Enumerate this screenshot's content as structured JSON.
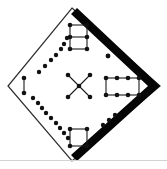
{
  "figure": {
    "canvas": {
      "width": 167,
      "height": 169,
      "background": "#ffffff"
    },
    "colors": {
      "node": "#111111",
      "link": "#1a1a1a",
      "outline": "#2b2b2b",
      "band": "#050505",
      "rule": "#d2d2d2"
    },
    "diamond": {
      "label": "diamond-outline",
      "points": "72,8 160,86 72,161 8,86",
      "top": [
        72,
        8
      ],
      "right": [
        160,
        86
      ],
      "bottom": [
        72,
        161
      ],
      "left": [
        8,
        86
      ]
    },
    "band": {
      "label": "thick-black-band",
      "points": "77,8 160,86 77,161 71,155 148,86 71,14"
    },
    "page_rule": {
      "label": "page-separator-line",
      "y": 160,
      "x1": 0,
      "x2": 167
    },
    "groups": [
      {
        "name": "top-rectangle",
        "kind": "grid-graph",
        "node_radius": 2.3,
        "nodes": [
          [
            70,
            25
          ],
          [
            87,
            25
          ],
          [
            70,
            37
          ],
          [
            87,
            37
          ],
          [
            70,
            49
          ],
          [
            87,
            49
          ]
        ],
        "edges": [
          [
            0,
            1
          ],
          [
            2,
            3
          ],
          [
            4,
            5
          ],
          [
            0,
            2
          ],
          [
            2,
            4
          ],
          [
            1,
            3
          ],
          [
            3,
            5
          ]
        ]
      },
      {
        "name": "right-rectangle",
        "kind": "grid-graph",
        "node_radius": 2.3,
        "nodes": [
          [
            106,
            78
          ],
          [
            117,
            78
          ],
          [
            128,
            78
          ],
          [
            139,
            78
          ],
          [
            106,
            95
          ],
          [
            117,
            95
          ],
          [
            128,
            95
          ],
          [
            139,
            95
          ]
        ],
        "edges": [
          [
            0,
            1
          ],
          [
            1,
            2
          ],
          [
            2,
            3
          ],
          [
            4,
            5
          ],
          [
            5,
            6
          ],
          [
            6,
            7
          ],
          [
            0,
            4
          ],
          [
            3,
            7
          ]
        ]
      },
      {
        "name": "bottom-square",
        "kind": "grid-graph",
        "node_radius": 2.3,
        "nodes": [
          [
            70,
            129
          ],
          [
            87,
            129
          ],
          [
            70,
            146
          ],
          [
            87,
            146
          ]
        ],
        "edges": [
          [
            0,
            1
          ],
          [
            2,
            3
          ],
          [
            0,
            2
          ],
          [
            1,
            3
          ]
        ]
      },
      {
        "name": "center-star",
        "kind": "star-graph",
        "node_radius": 2.3,
        "nodes": [
          [
            79,
            86
          ],
          [
            68,
            75
          ],
          [
            90,
            75
          ],
          [
            68,
            97
          ],
          [
            90,
            97
          ]
        ],
        "edges": [
          [
            0,
            1
          ],
          [
            0,
            2
          ],
          [
            0,
            3
          ],
          [
            0,
            4
          ]
        ]
      },
      {
        "name": "upper-left-dotted-chain",
        "kind": "path-chain",
        "node_radius": 2.2,
        "nodes": [
          [
            39,
            72
          ],
          [
            45,
            66
          ],
          [
            51,
            60
          ],
          [
            56,
            55
          ],
          [
            61,
            49
          ],
          [
            64,
            44
          ],
          [
            67,
            38
          ]
        ],
        "edges": []
      },
      {
        "name": "lower-left-dotted-chain",
        "kind": "path-chain",
        "node_radius": 2.2,
        "nodes": [
          [
            33,
            98
          ],
          [
            38,
            103
          ],
          [
            42,
            108
          ],
          [
            46,
            113
          ],
          [
            51,
            118
          ],
          [
            56,
            123
          ],
          [
            60,
            128
          ],
          [
            64,
            133
          ],
          [
            68,
            138
          ]
        ],
        "edges": []
      },
      {
        "name": "left-vertical-segment",
        "kind": "edge-pair",
        "node_radius": 2.3,
        "nodes": [
          [
            24,
            78
          ],
          [
            24,
            93
          ]
        ],
        "edges": [
          [
            0,
            1
          ]
        ]
      },
      {
        "name": "lower-right-dotted-chain",
        "kind": "path-chain",
        "node_radius": 2.2,
        "nodes": [
          [
            103,
            125
          ],
          [
            109,
            120
          ],
          [
            115,
            115
          ]
        ],
        "edges": []
      },
      {
        "name": "isolated-dot-upper-right",
        "kind": "isolated-node",
        "node_radius": 2.4,
        "nodes": [
          [
            108,
            56
          ]
        ],
        "edges": []
      }
    ]
  }
}
